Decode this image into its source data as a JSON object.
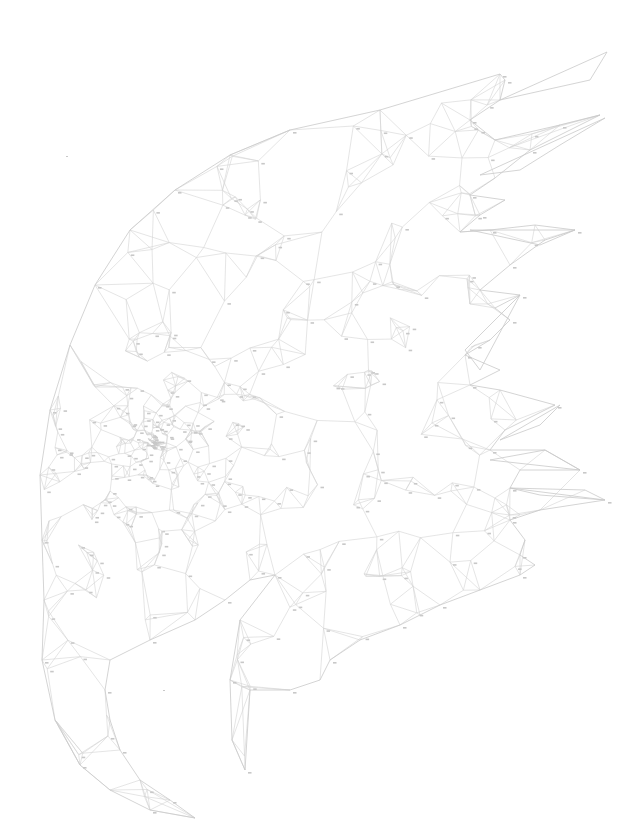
{
  "artwork": {
    "subject": "eagle head (low-poly line drawing, paint-by-numbers style)",
    "background": "#ffffff",
    "line_color": "#d4d4d4",
    "outline_color": "#c9c9c9",
    "stray_marks": [
      [
        66,
        156
      ],
      [
        163,
        690
      ]
    ],
    "head_outline": [
      [
        500,
        74
      ],
      [
        380,
        110
      ],
      [
        290,
        130
      ],
      [
        230,
        155
      ],
      [
        175,
        190
      ],
      [
        130,
        230
      ],
      [
        95,
        285
      ],
      [
        70,
        345
      ],
      [
        50,
        410
      ],
      [
        40,
        475
      ],
      [
        42,
        540
      ],
      [
        44,
        600
      ],
      [
        42,
        660
      ],
      [
        55,
        720
      ],
      [
        80,
        765
      ],
      [
        110,
        790
      ],
      [
        150,
        810
      ],
      [
        195,
        818
      ],
      [
        170,
        800
      ],
      [
        140,
        780
      ],
      [
        120,
        750
      ],
      [
        110,
        720
      ],
      [
        105,
        690
      ],
      [
        110,
        660
      ],
      [
        150,
        640
      ],
      [
        195,
        620
      ],
      [
        225,
        600
      ],
      [
        250,
        580
      ],
      [
        275,
        575
      ],
      [
        240,
        620
      ],
      [
        230,
        680
      ],
      [
        232,
        740
      ],
      [
        245,
        770
      ],
      [
        250,
        690
      ],
      [
        290,
        690
      ],
      [
        320,
        680
      ],
      [
        330,
        660
      ],
      [
        360,
        640
      ],
      [
        400,
        625
      ],
      [
        420,
        615
      ],
      [
        440,
        605
      ],
      [
        480,
        590
      ],
      [
        520,
        575
      ],
      [
        535,
        565
      ],
      [
        520,
        555
      ],
      [
        525,
        540
      ],
      [
        510,
        520
      ],
      [
        540,
        510
      ],
      [
        605,
        500
      ],
      [
        585,
        490
      ],
      [
        510,
        488
      ],
      [
        520,
        470
      ],
      [
        580,
        470
      ],
      [
        545,
        450
      ],
      [
        490,
        450
      ],
      [
        505,
        430
      ],
      [
        555,
        405
      ],
      [
        500,
        390
      ],
      [
        470,
        385
      ],
      [
        500,
        370
      ],
      [
        465,
        355
      ],
      [
        490,
        340
      ],
      [
        510,
        320
      ],
      [
        495,
        308
      ],
      [
        520,
        295
      ],
      [
        480,
        290
      ],
      [
        510,
        265
      ],
      [
        545,
        240
      ],
      [
        575,
        230
      ],
      [
        535,
        225
      ],
      [
        490,
        230
      ],
      [
        460,
        232
      ],
      [
        480,
        215
      ],
      [
        505,
        200
      ],
      [
        470,
        195
      ],
      [
        495,
        178
      ],
      [
        530,
        150
      ],
      [
        600,
        115
      ],
      [
        560,
        125
      ],
      [
        495,
        140
      ],
      [
        470,
        120
      ],
      [
        500,
        100
      ],
      [
        505,
        80
      ]
    ],
    "feathers": [
      [
        [
          500,
          100
        ],
        [
          607,
          52
        ],
        [
          590,
          80
        ]
      ],
      [
        [
          480,
          175
        ],
        [
          605,
          118
        ],
        [
          560,
          145
        ],
        [
          520,
          170
        ]
      ],
      [
        [
          470,
          230
        ],
        [
          575,
          230
        ],
        [
          540,
          245
        ]
      ],
      [
        [
          465,
          350
        ],
        [
          520,
          295
        ],
        [
          480,
          370
        ]
      ],
      [
        [
          500,
          440
        ],
        [
          560,
          405
        ],
        [
          540,
          425
        ]
      ],
      [
        [
          490,
          460
        ],
        [
          580,
          470
        ],
        [
          545,
          450
        ]
      ],
      [
        [
          510,
          488
        ],
        [
          605,
          500
        ],
        [
          540,
          495
        ]
      ]
    ],
    "eye_center": [
      150,
      440
    ],
    "beak_tip": [
      195,
      818
    ],
    "jaw_tip": [
      245,
      770
    ]
  }
}
